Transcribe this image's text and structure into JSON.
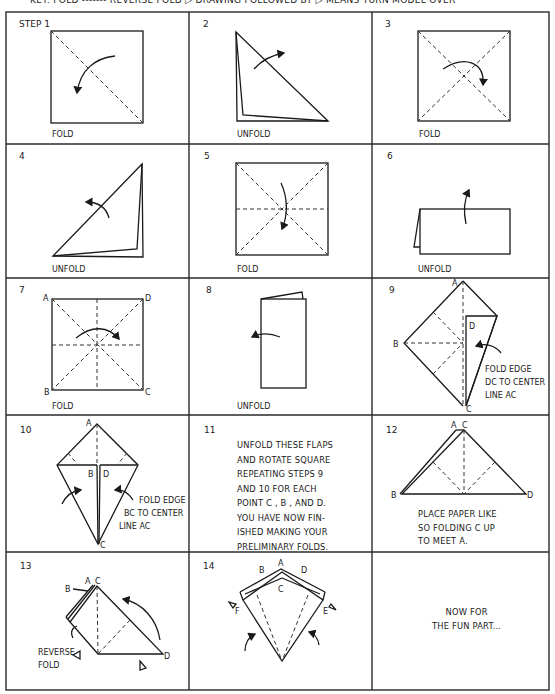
{
  "key": {
    "text": "KEY: FOLD ------- REVERSE FOLD ▷  DRAWING FOLLOWED BY ▷  MEANS TURN MODEL OVER"
  },
  "steps": [
    {
      "number": "STEP 1",
      "caption": "FOLD"
    },
    {
      "number": "2",
      "caption": "UNFOLD"
    },
    {
      "number": "3",
      "caption": "FOLD"
    },
    {
      "number": "4",
      "caption": "UNFOLD"
    },
    {
      "number": "5",
      "caption": "FOLD"
    },
    {
      "number": "6",
      "caption": "UNFOLD"
    },
    {
      "number": "7",
      "caption": "FOLD",
      "points": [
        "A",
        "D",
        "B",
        "C"
      ]
    },
    {
      "number": "8",
      "caption": "UNFOLD"
    },
    {
      "number": "9",
      "points": [
        "A",
        "B",
        "C",
        "D"
      ],
      "note_lines": [
        "FOLD EDGE",
        "DC TO CENTER",
        "LINE AC"
      ]
    },
    {
      "number": "10",
      "points": [
        "A",
        "B",
        "D",
        "C"
      ],
      "note_lines": [
        "FOLD EDGE",
        "BC TO CENTER",
        "LINE AC"
      ]
    },
    {
      "number": "11",
      "text": "UNFOLD THESE FLAPS\nAND ROTATE SQUARE\nREPEATING STEPS 9\nAND 10 FOR EACH\nPOINT C , B , AND D.\nYOU HAVE NOW FIN-\nISHED MAKING YOUR\nPRELIMINARY FOLDS."
    },
    {
      "number": "12",
      "points": [
        "A",
        "C",
        "B",
        "D"
      ],
      "text": "PLACE PAPER LIKE\nSO FOLDING C UP\nTO MEET A."
    },
    {
      "number": "13",
      "points": [
        "A",
        "C",
        "B",
        "D"
      ],
      "note_lines": [
        "REVERSE",
        "FOLD"
      ]
    },
    {
      "number": "14",
      "points": [
        "A",
        "B",
        "D",
        "C",
        "F",
        "E"
      ]
    },
    {
      "number": "",
      "text": "NOW FOR\nTHE FUN PART..."
    }
  ]
}
